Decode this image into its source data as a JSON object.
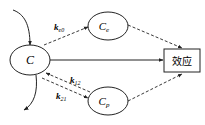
{
  "diagram": {
    "nodes": {
      "central": {
        "label": "C"
      },
      "effect_compartment": {
        "label": "C",
        "subscript": "e"
      },
      "peripheral": {
        "label": "C",
        "subscript": "p"
      },
      "effect": {
        "label": "效应"
      }
    },
    "edges": {
      "to_effect_compartment": {
        "label": "k",
        "subscript": "e0",
        "style": "dashed"
      },
      "central_to_peripheral": {
        "label": "k",
        "subscript": "12",
        "style": "dashed"
      },
      "peripheral_to_central": {
        "label": "k",
        "subscript": "21",
        "style": "dashed"
      },
      "central_to_effect": {
        "style": "solid"
      },
      "effect_compartment_to_effect": {
        "style": "dashed"
      },
      "peripheral_to_effect": {
        "style": "dashed"
      }
    },
    "colors": {
      "stroke": "#222222",
      "background": "#ffffff"
    }
  }
}
